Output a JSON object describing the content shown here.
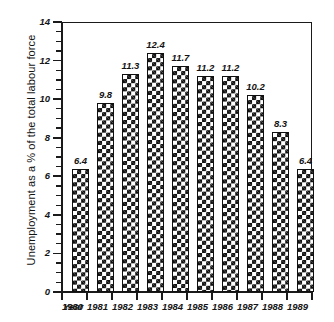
{
  "chart_data": {
    "type": "bar",
    "title": "",
    "xlabel": "Year",
    "ylabel": "Unemployment as a % of the total labour force",
    "categories": [
      "1980",
      "1981",
      "1982",
      "1983",
      "1984",
      "1985",
      "1986",
      "1987",
      "1988",
      "1989"
    ],
    "values": [
      6.4,
      9.8,
      11.3,
      12.4,
      11.7,
      11.2,
      11.2,
      10.2,
      8.3,
      6.4
    ],
    "data_labels": [
      "6.4",
      "9.8",
      "11.3",
      "12.4",
      "11.7",
      "11.2",
      "11.2",
      "10.2",
      "8.3",
      "6.4"
    ],
    "ylim": [
      0,
      14
    ],
    "ytick_labels": [
      "0",
      "2",
      "4",
      "6",
      "8",
      "10",
      "12",
      "14"
    ],
    "ytick_values": [
      0,
      2,
      4,
      6,
      8,
      10,
      12,
      14
    ],
    "yminor_step": 0.5,
    "grid": false,
    "legend": null,
    "series_fill": "checkerboard-black-white",
    "axis_color": "#1a1a1a",
    "text_color": "#151515"
  },
  "axes": {
    "x_axis_prefix_label": "Year"
  },
  "caption": {
    "text": ""
  }
}
